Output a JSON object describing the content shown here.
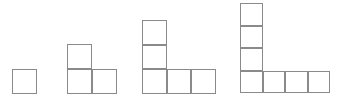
{
  "canvas": {
    "width": 348,
    "height": 100,
    "background_color": "#ffffff",
    "stroke_color": "#8a8a8a",
    "stroke_width": 1,
    "fill_color": "#ffffff",
    "baseline_y": 94,
    "description": "Four bottom-aligned L-shaped figures made of unit squares, growing left to right"
  },
  "chart_data": {
    "type": "diagram",
    "title": "",
    "xlabel": "",
    "ylabel": "",
    "pattern_description": "Sequence of L-shaped polyomino figures; figure n has n squares in a vertical column and n squares in a horizontal bottom row, sharing the corner square, for a total of 2n-1 squares",
    "categories": [
      "Figure 1",
      "Figure 2",
      "Figure 3",
      "Figure 4"
    ],
    "values": [
      1,
      3,
      5,
      7
    ],
    "series": [
      {
        "name": "column_height",
        "values": [
          1,
          2,
          3,
          4
        ]
      },
      {
        "name": "row_width",
        "values": [
          1,
          2,
          3,
          4
        ]
      },
      {
        "name": "total_squares",
        "values": [
          1,
          3,
          5,
          7
        ]
      }
    ]
  },
  "figures": [
    {
      "name": "figure-1",
      "label": "1",
      "origin_x": 12,
      "origin_y": 69,
      "cell_size": 25,
      "column_height": 1,
      "row_width": 1,
      "total_squares": 1,
      "cells": [
        {
          "col": 0,
          "row": 0
        }
      ]
    },
    {
      "name": "figure-2",
      "label": "2",
      "origin_x": 67,
      "origin_y": 44,
      "cell_size": 25,
      "column_height": 2,
      "row_width": 2,
      "total_squares": 3,
      "cells": [
        {
          "col": 0,
          "row": 0
        },
        {
          "col": 0,
          "row": 1
        },
        {
          "col": 1,
          "row": 1
        }
      ]
    },
    {
      "name": "figure-3",
      "label": "3",
      "origin_x": 142,
      "origin_y": 20,
      "cell_size": 24.7,
      "column_height": 3,
      "row_width": 3,
      "total_squares": 5,
      "cells": [
        {
          "col": 0,
          "row": 0
        },
        {
          "col": 0,
          "row": 1
        },
        {
          "col": 0,
          "row": 2
        },
        {
          "col": 1,
          "row": 2
        },
        {
          "col": 2,
          "row": 2
        }
      ]
    },
    {
      "name": "figure-4",
      "label": "4",
      "origin_x": 240,
      "origin_y": 3,
      "cell_size": 22.6,
      "column_height": 4,
      "row_width": 4,
      "total_squares": 7,
      "cells": [
        {
          "col": 0,
          "row": 0
        },
        {
          "col": 0,
          "row": 1
        },
        {
          "col": 0,
          "row": 2
        },
        {
          "col": 0,
          "row": 3
        },
        {
          "col": 1,
          "row": 3
        },
        {
          "col": 2,
          "row": 3
        },
        {
          "col": 3,
          "row": 3
        }
      ]
    }
  ]
}
